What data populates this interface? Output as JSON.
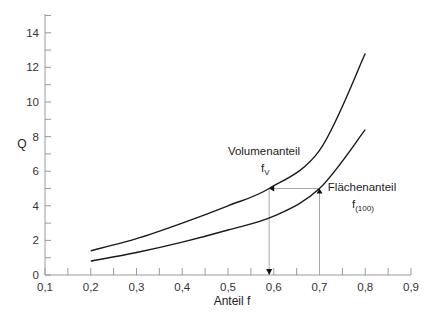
{
  "chart_data": {
    "type": "line",
    "title": "",
    "xlabel": "Anteil f",
    "ylabel": "Q",
    "xlim": [
      0.1,
      0.9
    ],
    "ylim": [
      0,
      15
    ],
    "x_ticks": [
      "0,1",
      "0,2",
      "0,3",
      "0,4",
      "0,5",
      "0,6",
      "0,7",
      "0,8",
      "0,9"
    ],
    "y_ticks": [
      "0",
      "2",
      "4",
      "6",
      "8",
      "10",
      "12",
      "14"
    ],
    "grid": false,
    "legend": "none (inline annotations)",
    "series": [
      {
        "name": "Volumenanteil f_V",
        "x": [
          0.2,
          0.3,
          0.4,
          0.5,
          0.59,
          0.7,
          0.8
        ],
        "values": [
          1.4,
          2.1,
          3.0,
          4.0,
          5.0,
          7.2,
          12.8
        ]
      },
      {
        "name": "Flächenanteil f_(100)",
        "x": [
          0.2,
          0.3,
          0.4,
          0.5,
          0.6,
          0.7,
          0.8
        ],
        "values": [
          0.8,
          1.3,
          1.9,
          2.6,
          3.4,
          5.0,
          8.4
        ]
      }
    ],
    "annotations": [
      {
        "text": "Volumenanteil",
        "sub": "f",
        "subscript": "V"
      },
      {
        "text": "Flächenanteil",
        "sub": "f",
        "subscript": "(100)"
      },
      {
        "type": "guide",
        "description": "vertical from f=0.7 up to Flächenanteil curve at Q=5, horizontal to Volumenanteil curve at f≈0.59, then down to x-axis",
        "q": 5.0,
        "f_from": 0.7,
        "f_to": 0.59
      }
    ]
  }
}
